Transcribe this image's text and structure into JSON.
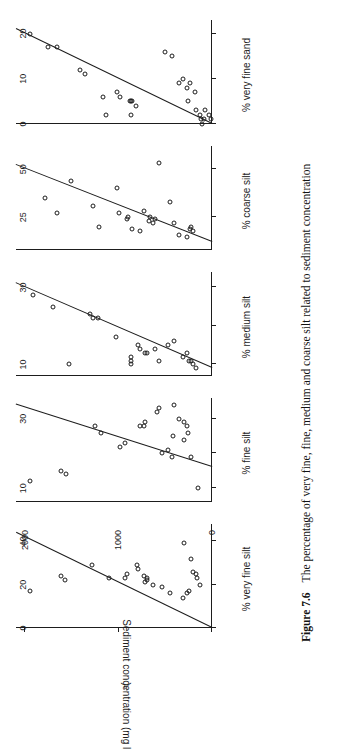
{
  "figure": {
    "caption_label": "Figure 7.6",
    "caption_text": "The percentage of very fine, fine, medium and coarse silt related to sediment concentration",
    "orientation": "rotated-90-ccw",
    "ink_color": "#1d1d1d",
    "background": "#ffffff"
  },
  "yaxis": {
    "label_main": "Sediment concentration (mg l",
    "label_sup": "-1",
    "label_tail": ")",
    "ticks": [
      0,
      1000,
      2000
    ],
    "ticklabels": [
      "0",
      "1000",
      "2000"
    ],
    "min": 0,
    "max": 2100
  },
  "chart_data": [
    {
      "type": "scatter",
      "title": "% very fine silt",
      "xlabel": "% very fine silt",
      "ylabel": "Sediment concentration (mg l-1)",
      "xlim": [
        0,
        48
      ],
      "ylim": [
        0,
        2100
      ],
      "xticks": [
        0,
        20,
        40
      ],
      "xticklabels": [
        "0",
        "20",
        "40"
      ],
      "yticks": [
        0,
        1000,
        2000
      ],
      "grid": false,
      "legend": false,
      "trendline": {
        "x0": 0,
        "y0": 0,
        "x1": 44,
        "y1": 2100
      },
      "points": [
        {
          "x": 17,
          "y": 1980
        },
        {
          "x": 22,
          "y": 1600
        },
        {
          "x": 24,
          "y": 1640
        },
        {
          "x": 29,
          "y": 1310
        },
        {
          "x": 23,
          "y": 1130
        },
        {
          "x": 23,
          "y": 960
        },
        {
          "x": 25,
          "y": 940
        },
        {
          "x": 27,
          "y": 820
        },
        {
          "x": 29,
          "y": 830
        },
        {
          "x": 24,
          "y": 760
        },
        {
          "x": 21,
          "y": 740
        },
        {
          "x": 23,
          "y": 720
        },
        {
          "x": 20,
          "y": 660
        },
        {
          "x": 22,
          "y": 720
        },
        {
          "x": 19,
          "y": 560
        },
        {
          "x": 16,
          "y": 480
        },
        {
          "x": 14,
          "y": 340
        },
        {
          "x": 16,
          "y": 300
        },
        {
          "x": 17,
          "y": 270
        },
        {
          "x": 39,
          "y": 330
        },
        {
          "x": 32,
          "y": 250
        },
        {
          "x": 26,
          "y": 230
        },
        {
          "x": 25,
          "y": 200
        },
        {
          "x": 23,
          "y": 190
        },
        {
          "x": 20,
          "y": 160
        }
      ]
    },
    {
      "type": "scatter",
      "title": "% fine silt",
      "xlabel": "% fine silt",
      "xlim": [
        6,
        36
      ],
      "ylim": [
        0,
        2100
      ],
      "xticks": [
        10,
        20,
        30
      ],
      "xticklabels": [
        "10",
        "",
        "30"
      ],
      "yticks": [
        0,
        1000,
        2000
      ],
      "grid": false,
      "legend": false,
      "trendline": {
        "x0": 16,
        "y0": 0,
        "x1": 34,
        "y1": 2100
      },
      "points": [
        {
          "x": 12,
          "y": 1980
        },
        {
          "x": 15,
          "y": 1640
        },
        {
          "x": 14,
          "y": 1590
        },
        {
          "x": 28,
          "y": 1280
        },
        {
          "x": 26,
          "y": 1220
        },
        {
          "x": 22,
          "y": 1010
        },
        {
          "x": 23,
          "y": 960
        },
        {
          "x": 28,
          "y": 800
        },
        {
          "x": 28,
          "y": 760
        },
        {
          "x": 29,
          "y": 740
        },
        {
          "x": 32,
          "y": 620
        },
        {
          "x": 33,
          "y": 600
        },
        {
          "x": 20,
          "y": 560
        },
        {
          "x": 21,
          "y": 500
        },
        {
          "x": 19,
          "y": 460
        },
        {
          "x": 25,
          "y": 440
        },
        {
          "x": 34,
          "y": 430
        },
        {
          "x": 30,
          "y": 380
        },
        {
          "x": 24,
          "y": 330
        },
        {
          "x": 29,
          "y": 330
        },
        {
          "x": 28,
          "y": 300
        },
        {
          "x": 26,
          "y": 280
        },
        {
          "x": 19,
          "y": 250
        },
        {
          "x": 10,
          "y": 180
        }
      ]
    },
    {
      "type": "scatter",
      "title": "% medium silt",
      "xlabel": "% medium silt",
      "xlim": [
        7,
        34
      ],
      "ylim": [
        0,
        2100
      ],
      "xticks": [
        10,
        20,
        30
      ],
      "xticklabels": [
        "10",
        "",
        "30"
      ],
      "yticks": [
        0,
        1000,
        2000
      ],
      "grid": false,
      "legend": false,
      "trendline": {
        "x0": 9,
        "y0": 0,
        "x1": 31,
        "y1": 2100
      },
      "points": [
        {
          "x": 28,
          "y": 1940
        },
        {
          "x": 25,
          "y": 1730
        },
        {
          "x": 22,
          "y": 1300
        },
        {
          "x": 23,
          "y": 1330
        },
        {
          "x": 22,
          "y": 1250
        },
        {
          "x": 10,
          "y": 1560
        },
        {
          "x": 17,
          "y": 1060
        },
        {
          "x": 14,
          "y": 800
        },
        {
          "x": 15,
          "y": 820
        },
        {
          "x": 13,
          "y": 740
        },
        {
          "x": 13,
          "y": 720
        },
        {
          "x": 10,
          "y": 900
        },
        {
          "x": 11,
          "y": 900
        },
        {
          "x": 12,
          "y": 890
        },
        {
          "x": 11,
          "y": 600
        },
        {
          "x": 14,
          "y": 640
        },
        {
          "x": 15,
          "y": 500
        },
        {
          "x": 16,
          "y": 430
        },
        {
          "x": 12,
          "y": 340
        },
        {
          "x": 13,
          "y": 300
        },
        {
          "x": 11,
          "y": 270
        },
        {
          "x": 11,
          "y": 250
        },
        {
          "x": 10,
          "y": 230
        },
        {
          "x": 9,
          "y": 200
        }
      ]
    },
    {
      "type": "scatter",
      "title": "% coarse silt",
      "xlabel": "% coarse silt",
      "xlim": [
        8,
        62
      ],
      "ylim": [
        0,
        2100
      ],
      "xticks": [
        25,
        50
      ],
      "xticklabels": [
        "25",
        "50"
      ],
      "yticks": [
        0,
        1000,
        2000
      ],
      "grid": false,
      "legend": false,
      "trendline": {
        "x0": 12,
        "y0": 0,
        "x1": 52,
        "y1": 2100
      },
      "points": [
        {
          "x": 35,
          "y": 1820
        },
        {
          "x": 27,
          "y": 1690
        },
        {
          "x": 44,
          "y": 1540
        },
        {
          "x": 31,
          "y": 1300
        },
        {
          "x": 20,
          "y": 1240
        },
        {
          "x": 40,
          "y": 1050
        },
        {
          "x": 27,
          "y": 1020
        },
        {
          "x": 24,
          "y": 940
        },
        {
          "x": 25,
          "y": 930
        },
        {
          "x": 19,
          "y": 880
        },
        {
          "x": 18,
          "y": 800
        },
        {
          "x": 28,
          "y": 760
        },
        {
          "x": 23,
          "y": 700
        },
        {
          "x": 25,
          "y": 690
        },
        {
          "x": 22,
          "y": 660
        },
        {
          "x": 24,
          "y": 640
        },
        {
          "x": 53,
          "y": 600
        },
        {
          "x": 33,
          "y": 480
        },
        {
          "x": 22,
          "y": 430
        },
        {
          "x": 16,
          "y": 380
        },
        {
          "x": 15,
          "y": 300
        },
        {
          "x": 19,
          "y": 260
        },
        {
          "x": 20,
          "y": 250
        },
        {
          "x": 18,
          "y": 230
        }
      ]
    },
    {
      "type": "scatter",
      "title": "% very fine sand",
      "xlabel": "% very fine sand",
      "xlim": [
        0,
        23
      ],
      "ylim": [
        0,
        2100
      ],
      "xticks": [
        0,
        10,
        20
      ],
      "xticklabels": [
        "0",
        "10",
        "20"
      ],
      "yticks": [
        0,
        1000,
        2000
      ],
      "grid": false,
      "legend": false,
      "trendline": {
        "x0": 0,
        "y0": 0,
        "x1": 21,
        "y1": 2100
      },
      "points": [
        {
          "x": 20,
          "y": 1980
        },
        {
          "x": 17,
          "y": 1780
        },
        {
          "x": 17,
          "y": 1690
        },
        {
          "x": 12,
          "y": 1440
        },
        {
          "x": 11,
          "y": 1390
        },
        {
          "x": 6,
          "y": 1190
        },
        {
          "x": 7,
          "y": 1050
        },
        {
          "x": 6,
          "y": 1010
        },
        {
          "x": 5,
          "y": 910
        },
        {
          "x": 5,
          "y": 890
        },
        {
          "x": 5,
          "y": 880
        },
        {
          "x": 4,
          "y": 840
        },
        {
          "x": 2,
          "y": 1160
        },
        {
          "x": 2,
          "y": 900
        },
        {
          "x": 16,
          "y": 530
        },
        {
          "x": 15,
          "y": 460
        },
        {
          "x": 9,
          "y": 380
        },
        {
          "x": 10,
          "y": 340
        },
        {
          "x": 8,
          "y": 300
        },
        {
          "x": 9,
          "y": 260
        },
        {
          "x": 5,
          "y": 280
        },
        {
          "x": 7,
          "y": 210
        },
        {
          "x": 3,
          "y": 200
        },
        {
          "x": 2,
          "y": 160
        },
        {
          "x": 1,
          "y": 150
        },
        {
          "x": 1,
          "y": 110
        },
        {
          "x": 3,
          "y": 100
        },
        {
          "x": 2,
          "y": 60
        },
        {
          "x": 0,
          "y": 130
        },
        {
          "x": 1,
          "y": 40
        }
      ]
    }
  ]
}
